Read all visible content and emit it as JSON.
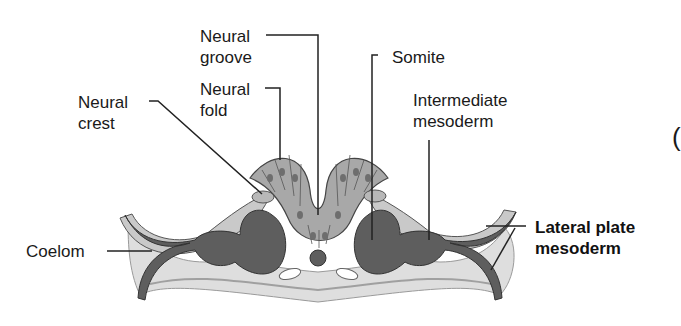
{
  "diagram": {
    "type": "biology cross-section",
    "colors": {
      "ectoderm_cells": "#c9c9c9",
      "neural_tube_cells": "#a8a8a8",
      "mesoderm_dark": "#5e5e5e",
      "background_tissue": "#dedede",
      "outline": "#3a3a3a"
    },
    "labels": {
      "neural_groove": {
        "line1": "Neural",
        "line2": "groove"
      },
      "neural_fold": {
        "line1": "Neural",
        "line2": "fold"
      },
      "neural_crest": {
        "line1": "Neural",
        "line2": "crest"
      },
      "somite": {
        "line1": "Somite"
      },
      "intermediate_mesoderm": {
        "line1": "Intermediate",
        "line2": "mesoderm"
      },
      "coelom": {
        "line1": "Coelom"
      },
      "lateral_plate_mesoderm": {
        "line1": "Lateral plate",
        "line2": "mesoderm"
      }
    },
    "edge_glyph": "("
  }
}
